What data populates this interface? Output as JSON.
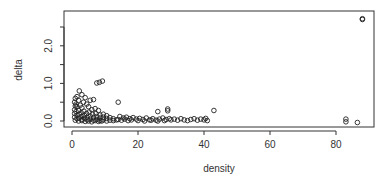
{
  "chart_data": {
    "type": "scatter",
    "title": "",
    "xlabel": "density",
    "ylabel": "delta",
    "xlim": [
      -2,
      91
    ],
    "ylim": [
      -0.15,
      2.85
    ],
    "xticks": [
      0,
      20,
      40,
      60,
      80
    ],
    "xtick_labels": [
      "0",
      "20",
      "40",
      "60",
      "80"
    ],
    "yticks": [
      0.0,
      0.5,
      1.0,
      1.5,
      2.0,
      2.5
    ],
    "ytick_labels": [
      "0.0",
      "",
      "1.0",
      "",
      "2.0",
      ""
    ],
    "grid": false,
    "legend": null,
    "marker": "open-circle",
    "series": [
      {
        "name": "points",
        "points": [
          [
            88,
            2.72
          ],
          [
            88,
            2.7
          ],
          [
            83,
            0.05
          ],
          [
            83,
            -0.02
          ],
          [
            86.5,
            -0.04
          ],
          [
            7.5,
            1.01
          ],
          [
            8.3,
            1.03
          ],
          [
            9.2,
            1.06
          ],
          [
            14,
            0.5
          ],
          [
            2.2,
            0.8
          ],
          [
            1.5,
            0.65
          ],
          [
            3.0,
            0.7
          ],
          [
            4.0,
            0.62
          ],
          [
            5.5,
            0.55
          ],
          [
            6.5,
            0.57
          ],
          [
            1.0,
            0.6
          ],
          [
            0.8,
            0.5
          ],
          [
            1.2,
            0.45
          ],
          [
            2.0,
            0.55
          ],
          [
            3.5,
            0.5
          ],
          [
            4.5,
            0.45
          ],
          [
            1.0,
            0.4
          ],
          [
            1.5,
            0.38
          ],
          [
            2.5,
            0.42
          ],
          [
            3.0,
            0.35
          ],
          [
            5.0,
            0.38
          ],
          [
            6.0,
            0.3
          ],
          [
            7.0,
            0.33
          ],
          [
            8.0,
            0.28
          ],
          [
            0.8,
            0.3
          ],
          [
            1.2,
            0.25
          ],
          [
            2.0,
            0.28
          ],
          [
            2.8,
            0.22
          ],
          [
            3.6,
            0.26
          ],
          [
            4.4,
            0.2
          ],
          [
            5.2,
            0.24
          ],
          [
            6.2,
            0.18
          ],
          [
            7.2,
            0.2
          ],
          [
            8.5,
            0.16
          ],
          [
            9.5,
            0.18
          ],
          [
            10.5,
            0.14
          ],
          [
            0.8,
            0.2
          ],
          [
            1.5,
            0.15
          ],
          [
            2.2,
            0.18
          ],
          [
            3.0,
            0.12
          ],
          [
            3.8,
            0.15
          ],
          [
            4.6,
            0.1
          ],
          [
            5.5,
            0.13
          ],
          [
            6.5,
            0.09
          ],
          [
            7.5,
            0.12
          ],
          [
            8.5,
            0.08
          ],
          [
            9.5,
            0.1
          ],
          [
            10.5,
            0.07
          ],
          [
            11.5,
            0.09
          ],
          [
            12.5,
            0.06
          ],
          [
            0.8,
            0.1
          ],
          [
            1.5,
            0.06
          ],
          [
            2.2,
            0.08
          ],
          [
            3.0,
            0.04
          ],
          [
            3.8,
            0.07
          ],
          [
            4.6,
            0.03
          ],
          [
            5.5,
            0.05
          ],
          [
            6.5,
            0.02
          ],
          [
            7.5,
            0.04
          ],
          [
            8.5,
            0.01
          ],
          [
            9.5,
            0.03
          ],
          [
            10.5,
            0.0
          ],
          [
            11.5,
            0.02
          ],
          [
            12.5,
            0.01
          ],
          [
            13.5,
            0.03
          ],
          [
            1.0,
            0.02
          ],
          [
            2.0,
            0.0
          ],
          [
            3.0,
            0.01
          ],
          [
            4.0,
            -0.01
          ],
          [
            5.0,
            0.0
          ],
          [
            6.0,
            -0.02
          ],
          [
            7.0,
            0.01
          ],
          [
            8.0,
            -0.01
          ],
          [
            9.0,
            0.0
          ],
          [
            14.5,
            0.12
          ],
          [
            15.5,
            0.08
          ],
          [
            16.5,
            0.1
          ],
          [
            17.5,
            0.06
          ],
          [
            18.5,
            0.09
          ],
          [
            19.5,
            0.05
          ],
          [
            14.0,
            0.04
          ],
          [
            15.0,
            0.02
          ],
          [
            16.0,
            0.05
          ],
          [
            17.0,
            0.01
          ],
          [
            18.0,
            0.03
          ],
          [
            20.5,
            0.07
          ],
          [
            21.5,
            0.04
          ],
          [
            22.5,
            0.08
          ],
          [
            23.5,
            0.03
          ],
          [
            24.5,
            0.06
          ],
          [
            25.5,
            0.02
          ],
          [
            26.5,
            0.05
          ],
          [
            27.5,
            0.08
          ],
          [
            28.5,
            0.04
          ],
          [
            29.5,
            0.06
          ],
          [
            20.0,
            0.01
          ],
          [
            22.0,
            0.0
          ],
          [
            24.0,
            0.02
          ],
          [
            26.0,
            0.0
          ],
          [
            28.0,
            0.01
          ],
          [
            30.0,
            0.03
          ],
          [
            26,
            0.25
          ],
          [
            29,
            0.32
          ],
          [
            29,
            0.27
          ],
          [
            31,
            0.05
          ],
          [
            32,
            0.02
          ],
          [
            33,
            0.06
          ],
          [
            34,
            0.03
          ],
          [
            35,
            0.01
          ],
          [
            36,
            0.04
          ],
          [
            37,
            0.06
          ],
          [
            38,
            0.02
          ],
          [
            39,
            0.05
          ],
          [
            40,
            0.03
          ],
          [
            40.5,
            0.07
          ],
          [
            41,
            0.01
          ],
          [
            43,
            0.28
          ]
        ]
      }
    ]
  }
}
